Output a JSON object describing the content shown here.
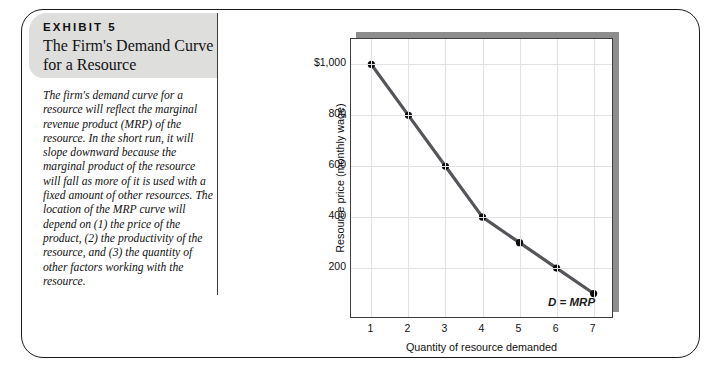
{
  "exhibit": {
    "kicker": "EXHIBIT 5",
    "title": "The Firm's Demand\nCurve for a Resource",
    "caption": "The firm's demand curve for a resource will reflect the marginal revenue product (MRP) of the resource. In the short run, it will slope downward because the marginal product of the resource will fall as more of it is used with a fixed amount of other resources. The location of the MRP curve will depend on (1) the price of the product, (2) the productivity of the resource, and (3) the quantity of other factors working with the resource."
  },
  "chart_data": {
    "type": "line",
    "title": "",
    "xlabel": "Quantity of resource demanded",
    "ylabel": "Resource price (monthly wage)",
    "x": [
      1,
      2,
      3,
      4,
      5,
      6,
      7
    ],
    "xtick_labels": [
      "1",
      "2",
      "3",
      "4",
      "5",
      "6",
      "7"
    ],
    "values": [
      1000,
      800,
      600,
      400,
      300,
      200,
      100
    ],
    "ytick_values": [
      200,
      400,
      600,
      800,
      1000
    ],
    "ytick_labels": [
      "200",
      "400",
      "600",
      "800",
      "$1,000"
    ],
    "ylim": [
      0,
      1100
    ],
    "xlim": [
      0.45,
      7.55
    ],
    "grid": true,
    "legend_position": "inside-bottom-right",
    "series": [
      {
        "name": "D = MRP",
        "values": [
          1000,
          800,
          600,
          400,
          300,
          200,
          100
        ]
      }
    ],
    "annotations": [
      {
        "text": "D = MRP",
        "x": 6.5,
        "y": 55
      }
    ],
    "colors": {
      "line": "#55555a",
      "marker": "#0d0d0d",
      "grid": "#e2e2e6",
      "axis": "#3d3d3d",
      "shadow": "#8d8d8d",
      "header_bg": "#dededd"
    }
  }
}
